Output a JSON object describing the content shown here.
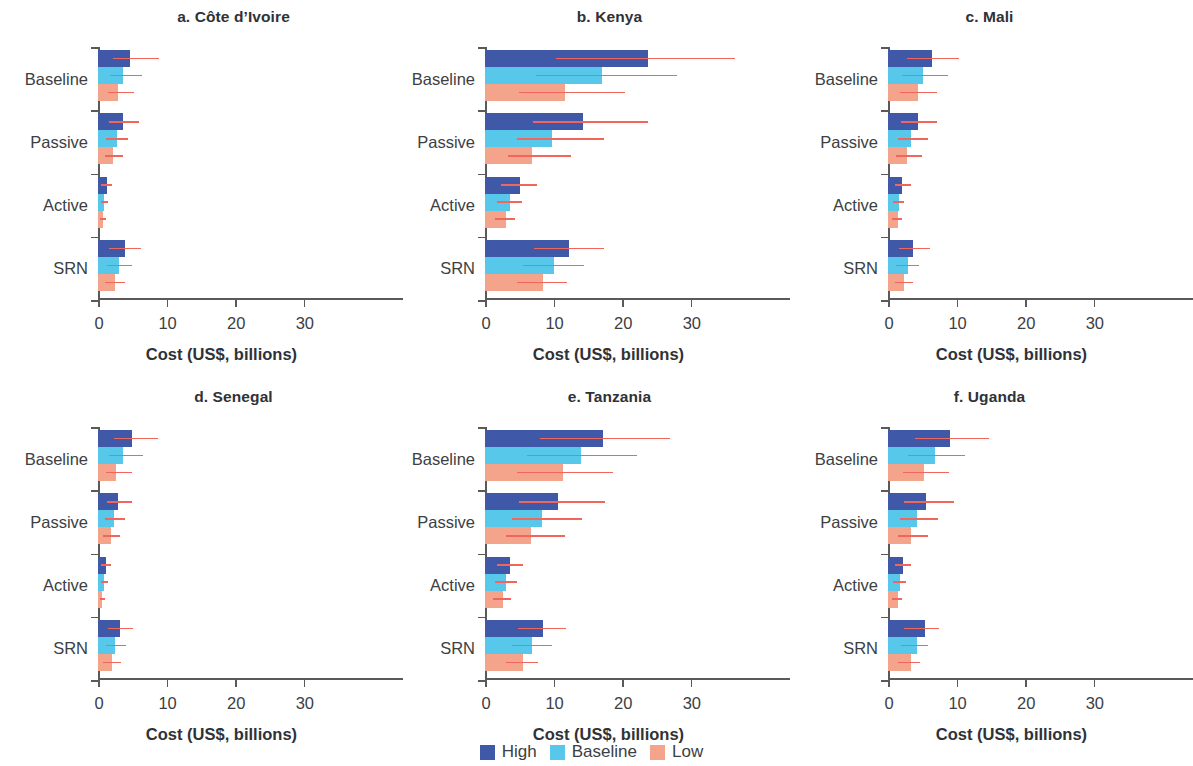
{
  "figure": {
    "x_axis_caption": "Cost (US$, billions)",
    "series_colors": {
      "high": "#3f58a8",
      "baseline": "#58c8ea",
      "low": "#f5a48c",
      "error": "#f0665c"
    }
  },
  "legend": {
    "items": [
      {
        "label": "High",
        "color": "#3f58a8",
        "icon": "legend-swatch"
      },
      {
        "label": "Baseline",
        "color": "#58c8ea",
        "icon": "legend-swatch"
      },
      {
        "label": "Low",
        "color": "#f5a48c",
        "icon": "legend-swatch"
      }
    ]
  },
  "chart_data": [
    {
      "type": "bar",
      "orientation": "horizontal",
      "panel": "a",
      "title": "a. Côte d’Ivoire",
      "xlabel": "Cost (US$, billions)",
      "ylabel": "",
      "xlim": [
        0,
        36
      ],
      "xticks": [
        0,
        10,
        20,
        30
      ],
      "xticklabels": [
        "0",
        "10",
        "20",
        "30"
      ],
      "categories": [
        "Baseline",
        "Passive",
        "Active",
        "SRN"
      ],
      "grid": false,
      "legend_position": "bottom-center-figure",
      "series": [
        {
          "name": "High",
          "color": "#3f58a8",
          "values": [
            4.7,
            3.6,
            1.3,
            3.9
          ],
          "err_low": [
            2.2,
            1.6,
            0.5,
            1.6
          ],
          "err_high": [
            8.9,
            6.0,
            2.1,
            6.2
          ]
        },
        {
          "name": "Baseline",
          "color": "#58c8ea",
          "values": [
            3.6,
            2.7,
            0.9,
            3.1
          ],
          "err_low": [
            1.7,
            1.2,
            0.4,
            1.3
          ],
          "err_high": [
            6.4,
            4.4,
            1.5,
            4.9
          ]
        },
        {
          "name": "Low",
          "color": "#f5a48c",
          "values": [
            2.9,
            2.2,
            0.7,
            2.5
          ],
          "err_low": [
            1.4,
            1.0,
            0.3,
            1.0
          ],
          "err_high": [
            5.2,
            3.6,
            1.2,
            4.0
          ]
        }
      ]
    },
    {
      "type": "bar",
      "orientation": "horizontal",
      "panel": "b",
      "title": "b. Kenya",
      "xlabel": "Cost (US$, billions)",
      "ylabel": "",
      "xlim": [
        0,
        36
      ],
      "xticks": [
        0,
        10,
        20,
        30
      ],
      "xticklabels": [
        "0",
        "10",
        "20",
        "30"
      ],
      "categories": [
        "Baseline",
        "Passive",
        "Active",
        "SRN"
      ],
      "grid": false,
      "legend_position": "bottom-center-figure",
      "series": [
        {
          "name": "High",
          "color": "#3f58a8",
          "values": [
            23.8,
            14.3,
            5.1,
            12.2
          ],
          "err_low": [
            10.4,
            7.0,
            2.4,
            7.2
          ],
          "err_high": [
            36.5,
            23.8,
            7.6,
            17.4
          ]
        },
        {
          "name": "Baseline",
          "color": "#58c8ea",
          "values": [
            17.1,
            9.7,
            3.7,
            10.0
          ],
          "err_low": [
            7.4,
            4.7,
            1.7,
            5.6
          ],
          "err_high": [
            28.0,
            17.4,
            5.4,
            14.4
          ]
        },
        {
          "name": "Low",
          "color": "#f5a48c",
          "values": [
            11.6,
            6.9,
            3.0,
            8.4
          ],
          "err_low": [
            5.0,
            3.3,
            1.4,
            4.6
          ],
          "err_high": [
            20.4,
            12.6,
            4.4,
            11.9
          ]
        }
      ]
    },
    {
      "type": "bar",
      "orientation": "horizontal",
      "panel": "c",
      "title": "c. Mali",
      "xlabel": "Cost (US$, billions)",
      "ylabel": "",
      "xlim": [
        0,
        36
      ],
      "xticks": [
        0,
        10,
        20,
        30
      ],
      "xticklabels": [
        "0",
        "10",
        "20",
        "30"
      ],
      "categories": [
        "Baseline",
        "Passive",
        "Active",
        "SRN"
      ],
      "grid": false,
      "legend_position": "bottom-center-figure",
      "series": [
        {
          "name": "High",
          "color": "#3f58a8",
          "values": [
            6.4,
            4.4,
            2.1,
            3.7
          ],
          "err_low": [
            2.8,
            1.9,
            1.0,
            1.6
          ],
          "err_high": [
            10.3,
            7.1,
            3.3,
            6.1
          ]
        },
        {
          "name": "Baseline",
          "color": "#58c8ea",
          "values": [
            5.1,
            3.4,
            1.6,
            2.9
          ],
          "err_low": [
            2.1,
            1.5,
            0.7,
            1.2
          ],
          "err_high": [
            8.8,
            5.9,
            2.4,
            4.5
          ]
        },
        {
          "name": "Low",
          "color": "#f5a48c",
          "values": [
            4.3,
            2.8,
            1.4,
            2.3
          ],
          "err_low": [
            1.8,
            1.2,
            0.6,
            1.0
          ],
          "err_high": [
            7.2,
            4.9,
            2.0,
            3.6
          ]
        }
      ]
    },
    {
      "type": "bar",
      "orientation": "horizontal",
      "panel": "d",
      "title": "d. Senegal",
      "xlabel": "Cost (US$, billions)",
      "ylabel": "",
      "xlim": [
        0,
        36
      ],
      "xticks": [
        0,
        10,
        20,
        30
      ],
      "xticklabels": [
        "0",
        "10",
        "20",
        "30"
      ],
      "categories": [
        "Baseline",
        "Passive",
        "Active",
        "SRN"
      ],
      "grid": false,
      "legend_position": "bottom-center-figure",
      "series": [
        {
          "name": "High",
          "color": "#3f58a8",
          "values": [
            5.0,
            2.9,
            1.2,
            3.2
          ],
          "err_low": [
            2.3,
            1.3,
            0.5,
            1.4
          ],
          "err_high": [
            8.8,
            5.0,
            1.9,
            5.1
          ]
        },
        {
          "name": "Baseline",
          "color": "#58c8ea",
          "values": [
            3.7,
            2.3,
            0.9,
            2.5
          ],
          "err_low": [
            1.6,
            1.0,
            0.4,
            1.1
          ],
          "err_high": [
            6.6,
            3.9,
            1.4,
            4.1
          ]
        },
        {
          "name": "Low",
          "color": "#f5a48c",
          "values": [
            2.6,
            1.9,
            0.6,
            2.0
          ],
          "err_low": [
            1.1,
            0.8,
            0.3,
            0.8
          ],
          "err_high": [
            5.0,
            3.2,
            1.0,
            3.3
          ]
        }
      ]
    },
    {
      "type": "bar",
      "orientation": "horizontal",
      "panel": "e",
      "title": "e. Tanzania",
      "xlabel": "Cost (US$, billions)",
      "ylabel": "",
      "xlim": [
        0,
        36
      ],
      "xticks": [
        0,
        10,
        20,
        30
      ],
      "xticklabels": [
        "0",
        "10",
        "20",
        "30"
      ],
      "categories": [
        "Baseline",
        "Passive",
        "Active",
        "SRN"
      ],
      "grid": false,
      "legend_position": "bottom-center-figure",
      "series": [
        {
          "name": "High",
          "color": "#3f58a8",
          "values": [
            17.2,
            10.6,
            3.7,
            8.5
          ],
          "err_low": [
            8.0,
            5.0,
            1.8,
            4.8
          ],
          "err_high": [
            27.0,
            17.5,
            5.6,
            11.8
          ]
        },
        {
          "name": "Baseline",
          "color": "#58c8ea",
          "values": [
            14.0,
            8.3,
            3.0,
            6.9
          ],
          "err_low": [
            6.1,
            3.9,
            1.4,
            3.9
          ],
          "err_high": [
            22.1,
            14.1,
            4.6,
            9.7
          ]
        },
        {
          "name": "Low",
          "color": "#f5a48c",
          "values": [
            11.4,
            6.7,
            2.6,
            5.5
          ],
          "err_low": [
            4.7,
            3.1,
            1.1,
            3.1
          ],
          "err_high": [
            18.6,
            11.6,
            3.8,
            7.7
          ]
        }
      ]
    },
    {
      "type": "bar",
      "orientation": "horizontal",
      "panel": "f",
      "title": "f. Uganda",
      "xlabel": "Cost (US$, billions)",
      "ylabel": "",
      "xlim": [
        0,
        36
      ],
      "xticks": [
        0,
        10,
        20,
        30
      ],
      "xticklabels": [
        "0",
        "10",
        "20",
        "30"
      ],
      "categories": [
        "Baseline",
        "Passive",
        "Active",
        "SRN"
      ],
      "grid": false,
      "legend_position": "bottom-center-figure",
      "series": [
        {
          "name": "High",
          "color": "#3f58a8",
          "values": [
            9.1,
            5.5,
            2.2,
            5.4
          ],
          "err_low": [
            4.0,
            2.4,
            1.0,
            2.4
          ],
          "err_high": [
            14.7,
            9.6,
            3.4,
            7.5
          ]
        },
        {
          "name": "Baseline",
          "color": "#58c8ea",
          "values": [
            6.9,
            4.2,
            1.7,
            4.2
          ],
          "err_low": [
            2.9,
            1.8,
            0.8,
            1.9
          ],
          "err_high": [
            11.2,
            7.3,
            2.6,
            5.9
          ]
        },
        {
          "name": "Low",
          "color": "#f5a48c",
          "values": [
            5.3,
            3.4,
            1.4,
            3.3
          ],
          "err_low": [
            2.2,
            1.5,
            0.6,
            1.5
          ],
          "err_high": [
            8.9,
            5.8,
            2.1,
            4.7
          ]
        }
      ]
    }
  ]
}
